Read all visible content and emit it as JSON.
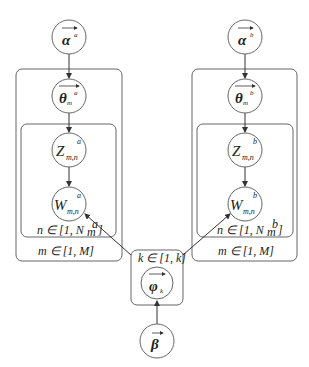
{
  "diagram": {
    "type": "plate-notation",
    "colors": {
      "stroke": "#555555",
      "background": "#ffffff",
      "text": "#222222"
    },
    "nodes": [
      {
        "id": "alpha_a",
        "symbol": "α",
        "superscript": "a",
        "subscript": "",
        "vector": true
      },
      {
        "id": "theta_a",
        "symbol": "θ",
        "superscript": "a",
        "subscript": "m",
        "vector": true
      },
      {
        "id": "z_a",
        "symbol": "Z",
        "superscript": "a",
        "subscript": "m,n",
        "vector": false
      },
      {
        "id": "w_a",
        "symbol": "W",
        "superscript": "a",
        "subscript": "m,n",
        "vector": false
      },
      {
        "id": "alpha_b",
        "symbol": "α",
        "superscript": "b",
        "subscript": "",
        "vector": true
      },
      {
        "id": "theta_b",
        "symbol": "θ",
        "superscript": "b",
        "subscript": "m",
        "vector": true
      },
      {
        "id": "z_b",
        "symbol": "Z",
        "superscript": "b",
        "subscript": "m,n",
        "vector": false
      },
      {
        "id": "w_b",
        "symbol": "W",
        "superscript": "b",
        "subscript": "m,n",
        "vector": false
      },
      {
        "id": "phi",
        "symbol": "φ",
        "superscript": "",
        "subscript": "k",
        "vector": true
      },
      {
        "id": "beta",
        "symbol": "β",
        "superscript": "",
        "subscript": "",
        "vector": true
      }
    ],
    "plates": {
      "left_inner": "n ∈ [1, N",
      "left_inner_sub": "m",
      "left_inner_sup": "a",
      "left_outer": "m ∈ [1, M]",
      "right_inner": "n ∈ [1, N",
      "right_inner_sub": "m",
      "right_inner_sup": "b",
      "right_outer": "m ∈ [1, M]",
      "center": "k ∈ [1, k]"
    },
    "edges": [
      [
        "alpha_a",
        "theta_a"
      ],
      [
        "theta_a",
        "z_a"
      ],
      [
        "z_a",
        "w_a"
      ],
      [
        "alpha_b",
        "theta_b"
      ],
      [
        "theta_b",
        "z_b"
      ],
      [
        "z_b",
        "w_b"
      ],
      [
        "beta",
        "phi"
      ],
      [
        "phi",
        "w_a"
      ],
      [
        "phi",
        "w_b"
      ]
    ]
  }
}
